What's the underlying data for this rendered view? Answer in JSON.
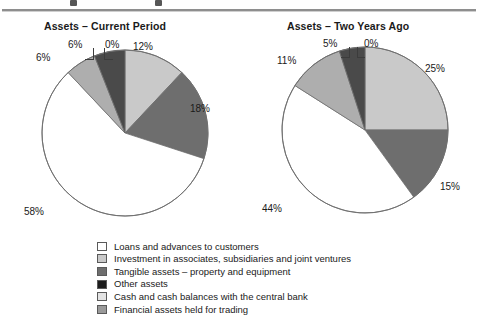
{
  "figure": {
    "width": 478,
    "height": 325,
    "background": "#ffffff",
    "rule_color": "#8e8e8e"
  },
  "charts": {
    "left": {
      "title": "Assets – Current Period"
    },
    "right": {
      "title": "Assets – Two Years Ago"
    }
  },
  "legend": {
    "items": [
      {
        "label": "Loans and advances to customers",
        "color": "#ffffff"
      },
      {
        "label": "Investment in associates, subsidiaries and joint ventures",
        "color": "#c9c9c9"
      },
      {
        "label": "Tangible assets – property and equipment",
        "color": "#6e6e6e"
      },
      {
        "label": "Other assets",
        "color": "#1c1c1c"
      },
      {
        "label": "Cash and cash balances with the central bank",
        "color": "#e3e3e3"
      },
      {
        "label": "Financial assets held for trading",
        "color": "#9a9a9a"
      }
    ]
  },
  "chart_data": [
    {
      "type": "pie",
      "title": "Assets – Current Period",
      "labels": [
        "Investment in associates, subsidiaries and joint ventures",
        "Tangible assets – property and equipment",
        "Loans and advances to customers",
        "Cash and cash balances with the central bank",
        "Financial assets held for trading",
        "Other assets"
      ],
      "values": [
        12,
        18,
        58,
        6,
        6,
        0
      ],
      "value_labels": [
        "12%",
        "18%",
        "58%",
        "6%",
        "6%",
        "0%"
      ],
      "colors": [
        "#c9c9c9",
        "#6e6e6e",
        "#ffffff",
        "#aeaeae",
        "#4a4a4a",
        "#111111"
      ],
      "start_angle_deg": 0,
      "direction": "clockwise",
      "legend_position": "bottom"
    },
    {
      "type": "pie",
      "title": "Assets – Two Years Ago",
      "labels": [
        "Investment in associates, subsidiaries and joint ventures",
        "Tangible assets – property and equipment",
        "Loans and advances to customers",
        "Cash and cash balances with the central bank",
        "Financial assets held for trading",
        "Other assets"
      ],
      "values": [
        25,
        15,
        44,
        11,
        5,
        0
      ],
      "value_labels": [
        "25%",
        "15%",
        "44%",
        "11%",
        "5%",
        "0%"
      ],
      "colors": [
        "#c9c9c9",
        "#6e6e6e",
        "#ffffff",
        "#aeaeae",
        "#4a4a4a",
        "#111111"
      ],
      "start_angle_deg": 0,
      "direction": "clockwise",
      "legend_position": "bottom"
    }
  ],
  "left_labels": {
    "l12": "12%",
    "l18": "18%",
    "l58": "58%",
    "l6a": "6%",
    "l6b": "6%",
    "l0": "0%"
  },
  "right_labels": {
    "l25": "25%",
    "l15": "15%",
    "l44": "44%",
    "l11": "11%",
    "l5": "5%",
    "l0": "0%"
  }
}
